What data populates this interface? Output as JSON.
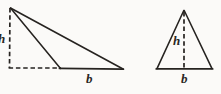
{
  "figure": {
    "background_color": "#fbfaf8",
    "stroke_color": "#262320",
    "labels": {
      "height_symbol": "h",
      "base_symbol": "b"
    },
    "shapes": [
      {
        "name": "obtuse-triangle",
        "type": "triangle",
        "solid_vertices": [
          [
            10,
            7
          ],
          [
            60,
            68
          ],
          [
            123,
            69
          ]
        ],
        "solid_edges": [
          {
            "name": "apex-to-foot-edge",
            "from": [
              10,
              7
            ],
            "to": [
              60,
              68
            ]
          },
          {
            "name": "base-edge",
            "from": [
              60,
              68
            ],
            "to": [
              123,
              69
            ]
          },
          {
            "name": "hypotenuse-edge",
            "from": [
              10,
              7
            ],
            "to": [
              123,
              69
            ]
          }
        ],
        "dashed_edges": [
          {
            "name": "height-line",
            "from": [
              10,
              7
            ],
            "to": [
              9,
              68
            ]
          },
          {
            "name": "base-extension-line",
            "from": [
              9,
              68
            ],
            "to": [
              60,
              68
            ]
          }
        ],
        "height_label": "h",
        "base_label": "b"
      },
      {
        "name": "isosceles-triangle",
        "type": "triangle",
        "solid_vertices": [
          [
            184,
            10
          ],
          [
            157,
            69
          ],
          [
            212,
            69
          ]
        ],
        "solid_edges": [
          {
            "name": "left-edge",
            "from": [
              184,
              10
            ],
            "to": [
              157,
              69
            ]
          },
          {
            "name": "base-edge",
            "from": [
              157,
              69
            ],
            "to": [
              212,
              69
            ]
          },
          {
            "name": "right-edge",
            "from": [
              212,
              69
            ],
            "to": [
              184,
              10
            ]
          }
        ],
        "dashed_edges": [
          {
            "name": "height-line",
            "from": [
              184,
              10
            ],
            "to": [
              184,
              69
            ]
          }
        ],
        "height_label": "h",
        "base_label": "b"
      }
    ]
  }
}
